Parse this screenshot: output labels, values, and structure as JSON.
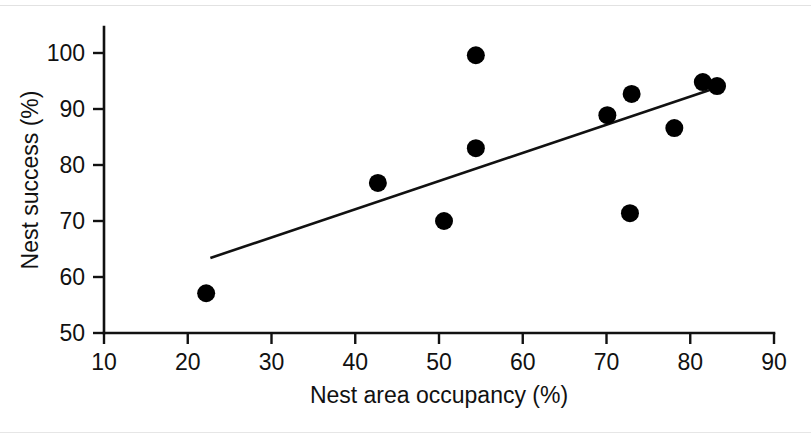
{
  "chart_data": {
    "type": "scatter",
    "title": "",
    "xlabel": "Nest area occupancy (%)",
    "ylabel": "Nest success (%)",
    "xlim": [
      10,
      90
    ],
    "ylim": [
      50,
      100
    ],
    "xticks": [
      10,
      20,
      30,
      40,
      50,
      60,
      70,
      80,
      90
    ],
    "xtick_labels": [
      "10",
      "20",
      "30",
      "40",
      "50",
      "60",
      "70",
      "80",
      "90"
    ],
    "yticks": [
      50,
      60,
      70,
      80,
      90,
      100
    ],
    "ytick_labels": [
      "50",
      "60",
      "70",
      "80",
      "90",
      "100"
    ],
    "grid": false,
    "legend": null,
    "marker": {
      "shape": "circle",
      "color": "#000000",
      "radius_px": 9
    },
    "points": [
      {
        "x": 22.2,
        "y": 57.1
      },
      {
        "x": 42.7,
        "y": 76.8
      },
      {
        "x": 50.6,
        "y": 70.0
      },
      {
        "x": 54.4,
        "y": 99.6
      },
      {
        "x": 54.4,
        "y": 83.0
      },
      {
        "x": 70.1,
        "y": 88.9
      },
      {
        "x": 72.8,
        "y": 71.4
      },
      {
        "x": 73.0,
        "y": 92.7
      },
      {
        "x": 78.1,
        "y": 86.6
      },
      {
        "x": 81.5,
        "y": 94.8
      },
      {
        "x": 83.2,
        "y": 94.1
      }
    ],
    "trend_line": {
      "type": "linear-fit",
      "color": "#111111",
      "x_start": 22.7,
      "y_start": 63.4,
      "x_end": 83.3,
      "y_end": 93.9
    }
  },
  "axes": {
    "x_title": "Nest area occupancy (%)",
    "y_title": "Nest success (%)"
  }
}
